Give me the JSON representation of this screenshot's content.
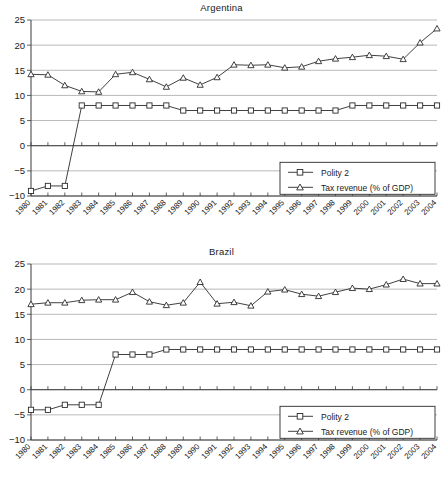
{
  "chart_data": [
    {
      "type": "line",
      "title": "Argentina",
      "xlabel": "",
      "ylabel": "",
      "ylim": [
        -10,
        25
      ],
      "yticks": [
        -10,
        -5,
        0,
        5,
        10,
        15,
        20,
        25
      ],
      "ytick_labels": [
        "−10",
        "−5",
        "0",
        "5",
        "10",
        "15",
        "20",
        "25"
      ],
      "grid": true,
      "legend_position": "bottom-right",
      "categories": [
        1980,
        1981,
        1982,
        1983,
        1984,
        1985,
        1986,
        1987,
        1988,
        1989,
        1990,
        1991,
        1992,
        1993,
        1994,
        1995,
        1996,
        1997,
        1998,
        1999,
        2000,
        2001,
        2002,
        2003,
        2004
      ],
      "xtick_labels": [
        "1980",
        "1981",
        "1982",
        "1983",
        "1984",
        "1985",
        "1986",
        "1987",
        "1988",
        "1989",
        "1990",
        "1991",
        "1992",
        "1993",
        "1994",
        "1995",
        "1996",
        "1997",
        "1998",
        "1999",
        "2000",
        "2001",
        "2002",
        "2003",
        "2004"
      ],
      "series": [
        {
          "name": "Polity 2",
          "marker": "square",
          "values": [
            -9,
            -8,
            -8,
            8,
            8,
            8,
            8,
            8,
            8,
            7,
            7,
            7,
            7,
            7,
            7,
            7,
            7,
            7,
            7,
            8,
            8,
            8,
            8,
            8,
            8
          ]
        },
        {
          "name": "Tax revenue (% of GDP)",
          "marker": "triangle",
          "values": [
            14.2,
            14.1,
            12.0,
            10.8,
            10.7,
            14.2,
            14.6,
            13.2,
            11.7,
            13.5,
            12.1,
            13.6,
            16.1,
            16.0,
            16.1,
            15.5,
            15.7,
            16.8,
            17.3,
            17.6,
            18.0,
            17.8,
            17.2,
            20.5,
            23.3
          ]
        }
      ]
    },
    {
      "type": "line",
      "title": "Brazil",
      "xlabel": "",
      "ylabel": "",
      "ylim": [
        -10,
        25
      ],
      "yticks": [
        -10,
        -5,
        0,
        5,
        10,
        15,
        20,
        25
      ],
      "ytick_labels": [
        "−10",
        "−5",
        "0",
        "5",
        "10",
        "15",
        "20",
        "25"
      ],
      "grid": true,
      "legend_position": "bottom-right",
      "categories": [
        1980,
        1981,
        1982,
        1983,
        1984,
        1985,
        1986,
        1987,
        1988,
        1989,
        1990,
        1991,
        1992,
        1993,
        1994,
        1995,
        1996,
        1997,
        1998,
        1999,
        2000,
        2001,
        2002,
        2003,
        2004
      ],
      "xtick_labels": [
        "1980",
        "1981",
        "1982",
        "1983",
        "1984",
        "1985",
        "1986",
        "1987",
        "1988",
        "1989",
        "1990",
        "1991",
        "1992",
        "1993",
        "1994",
        "1995",
        "1996",
        "1997",
        "1998",
        "1999",
        "2000",
        "2001",
        "2002",
        "2003",
        "2004"
      ],
      "series": [
        {
          "name": "Polity 2",
          "marker": "square",
          "values": [
            -4,
            -4,
            -3,
            -3,
            -3,
            7,
            7,
            7,
            8,
            8,
            8,
            8,
            8,
            8,
            8,
            8,
            8,
            8,
            8,
            8,
            8,
            8,
            8,
            8,
            8
          ]
        },
        {
          "name": "Tax revenue (% of GDP)",
          "marker": "triangle",
          "values": [
            17.0,
            17.3,
            17.3,
            17.8,
            17.9,
            17.9,
            19.4,
            17.5,
            16.8,
            17.3,
            21.4,
            17.1,
            17.4,
            16.7,
            19.5,
            19.9,
            19.0,
            18.6,
            19.4,
            20.2,
            20.0,
            20.9,
            22.0,
            21.1,
            21.1
          ]
        }
      ]
    }
  ],
  "colors": {
    "line": "#2b2b2b",
    "grid": "#9a9a9a",
    "axis": "#3a3a3a",
    "background": "#ffffff"
  }
}
